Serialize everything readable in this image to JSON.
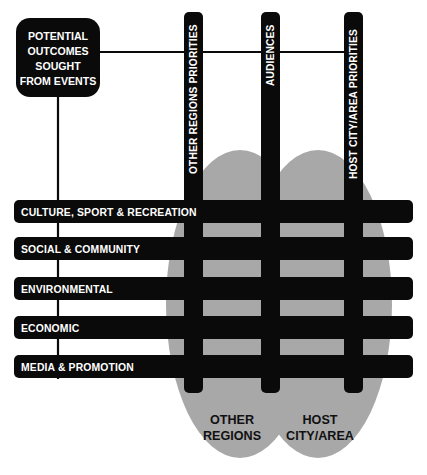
{
  "diagram": {
    "title_box": {
      "lines": [
        "POTENTIAL",
        "OUTCOMES",
        "SOUGHT",
        "FROM EVENTS"
      ],
      "name": "potential-outcomes-sought-from-events"
    },
    "vertical_bars": [
      {
        "label": "OTHER REGIONS PRIORITIES",
        "name": "other-regions-priorities"
      },
      {
        "label": "AUDIENCES",
        "name": "audiences"
      },
      {
        "label": "HOST CITY/AREA PRIORITIES",
        "name": "host-city-area-priorities"
      }
    ],
    "horizontal_bars": [
      {
        "label": "CULTURE, SPORT & RECREATION",
        "name": "culture-sport-recreation"
      },
      {
        "label": "SOCIAL & COMMUNITY",
        "name": "social-community"
      },
      {
        "label": "ENVIRONMENTAL",
        "name": "environmental"
      },
      {
        "label": "ECONOMIC",
        "name": "economic"
      },
      {
        "label": "MEDIA & PROMOTION",
        "name": "media-promotion"
      }
    ],
    "regions": [
      {
        "lines": [
          "OTHER",
          "REGIONS"
        ],
        "name": "other-regions"
      },
      {
        "lines": [
          "HOST",
          "CITY/AREA"
        ],
        "name": "host-city-area"
      }
    ],
    "colors": {
      "bar": "#0a0a0a",
      "ellipse": "#a8a8a8",
      "background": "#ffffff",
      "bar_text": "#ffffff",
      "region_text": "#111111"
    }
  }
}
